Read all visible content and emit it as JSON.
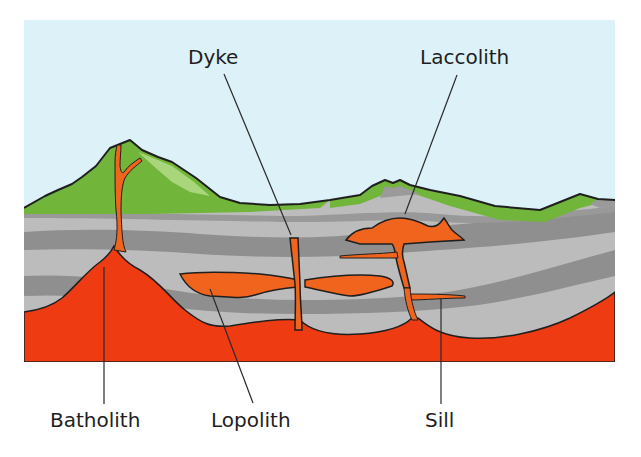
{
  "diagram": {
    "colors": {
      "sky": "#dcf1f8",
      "grass": "#72b53b",
      "grass_light": "#a9d67b",
      "rock_light": "#bcbcbc",
      "rock_dark": "#8f8f8f",
      "magma": "#ee3b12",
      "intrusion": "#f0641e",
      "outline": "#1f1f1f",
      "text": "#1e1e1e"
    },
    "labels": {
      "dyke": "Dyke",
      "laccolith": "Laccolith",
      "batholith": "Batholith",
      "lopolith": "Lopolith",
      "sill": "Sill"
    }
  }
}
